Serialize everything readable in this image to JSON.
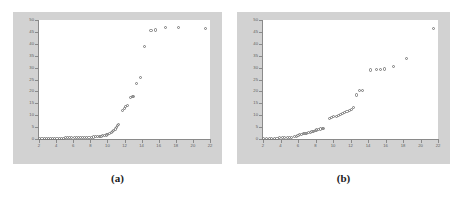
{
  "figure": {
    "background_color": "#ffffff",
    "panel_background_color": "#d2d2d2",
    "plot_background_color": "#ffffff",
    "marker_color": "#7a7a7a",
    "axis_color": "#8a8a8a"
  },
  "panels": [
    {
      "caption": "(a)"
    },
    {
      "caption": "(b)"
    }
  ],
  "chart_data": [
    {
      "type": "scatter",
      "title": "",
      "subtitle": "",
      "caption": "(a)",
      "xlabel": "",
      "ylabel": "",
      "xlim": [
        2,
        22
      ],
      "ylim": [
        0,
        50
      ],
      "xticks": [
        2,
        4,
        6,
        8,
        10,
        12,
        14,
        16,
        18,
        20,
        22
      ],
      "xtick_labels": [
        "2",
        "4",
        "6",
        "8",
        "10",
        "12",
        "14",
        "16",
        "18",
        "20",
        "22"
      ],
      "yticks": [
        0,
        5,
        10,
        15,
        20,
        25,
        30,
        35,
        40,
        45,
        50
      ],
      "ytick_labels": [
        "0",
        "5",
        "10",
        "15",
        "20",
        "25",
        "30",
        "35",
        "40",
        "45",
        "50"
      ],
      "grid": false,
      "legend": null,
      "marker": "open-circle",
      "points": [
        [
          2.1,
          0.2
        ],
        [
          2.35,
          0.2
        ],
        [
          2.6,
          0.25
        ],
        [
          2.85,
          0.25
        ],
        [
          3.1,
          0.3
        ],
        [
          3.35,
          0.3
        ],
        [
          3.6,
          0.3
        ],
        [
          3.85,
          0.35
        ],
        [
          4.1,
          0.35
        ],
        [
          4.35,
          0.4
        ],
        [
          4.6,
          0.4
        ],
        [
          4.85,
          0.4
        ],
        [
          5.1,
          0.45
        ],
        [
          5.35,
          0.45
        ],
        [
          5.6,
          0.5
        ],
        [
          5.85,
          0.5
        ],
        [
          6.1,
          0.55
        ],
        [
          6.35,
          0.55
        ],
        [
          6.6,
          0.6
        ],
        [
          6.85,
          0.6
        ],
        [
          7.1,
          0.65
        ],
        [
          7.35,
          0.7
        ],
        [
          7.6,
          0.7
        ],
        [
          7.85,
          0.75
        ],
        [
          8.1,
          0.8
        ],
        [
          8.35,
          0.85
        ],
        [
          8.6,
          0.9
        ],
        [
          8.85,
          1.0
        ],
        [
          9.05,
          1.1
        ],
        [
          9.25,
          1.2
        ],
        [
          9.45,
          1.35
        ],
        [
          9.65,
          1.5
        ],
        [
          9.85,
          1.7
        ],
        [
          10.05,
          1.9
        ],
        [
          10.25,
          2.2
        ],
        [
          10.45,
          2.6
        ],
        [
          10.6,
          3.0
        ],
        [
          10.75,
          3.5
        ],
        [
          10.9,
          4.2
        ],
        [
          11.05,
          5.0
        ],
        [
          11.2,
          5.6
        ],
        [
          11.35,
          6.0
        ],
        [
          11.8,
          12.0
        ],
        [
          11.95,
          12.8
        ],
        [
          12.15,
          13.8
        ],
        [
          12.35,
          14.2
        ],
        [
          12.7,
          17.5
        ],
        [
          12.9,
          17.8
        ],
        [
          13.1,
          18.0
        ],
        [
          13.45,
          23.5
        ],
        [
          13.9,
          25.8
        ],
        [
          14.35,
          39.0
        ],
        [
          15.1,
          45.5
        ],
        [
          15.6,
          45.8
        ],
        [
          16.8,
          46.8
        ],
        [
          18.35,
          46.8
        ],
        [
          21.5,
          46.5
        ]
      ]
    },
    {
      "type": "scatter",
      "title": "",
      "subtitle": "",
      "caption": "(b)",
      "xlabel": "",
      "ylabel": "",
      "xlim": [
        2,
        22
      ],
      "ylim": [
        0,
        50
      ],
      "xticks": [
        2,
        4,
        6,
        8,
        10,
        12,
        14,
        16,
        18,
        20,
        22
      ],
      "xtick_labels": [
        "2",
        "4",
        "6",
        "8",
        "10",
        "12",
        "14",
        "16",
        "18",
        "20",
        "22"
      ],
      "yticks": [
        0,
        5,
        10,
        15,
        20,
        25,
        30,
        35,
        40,
        45,
        50
      ],
      "ytick_labels": [
        "0",
        "5",
        "10",
        "15",
        "20",
        "25",
        "30",
        "35",
        "40",
        "45",
        "50"
      ],
      "grid": false,
      "legend": null,
      "marker": "open-circle",
      "points": [
        [
          2.1,
          0.2
        ],
        [
          2.4,
          0.25
        ],
        [
          2.7,
          0.3
        ],
        [
          3.0,
          0.3
        ],
        [
          3.3,
          0.35
        ],
        [
          3.6,
          0.4
        ],
        [
          3.9,
          0.45
        ],
        [
          4.2,
          0.5
        ],
        [
          4.5,
          0.55
        ],
        [
          4.8,
          0.6
        ],
        [
          5.05,
          0.7
        ],
        [
          5.3,
          0.8
        ],
        [
          5.55,
          0.9
        ],
        [
          5.8,
          1.0
        ],
        [
          6.0,
          1.6
        ],
        [
          6.2,
          1.8
        ],
        [
          6.4,
          2.0
        ],
        [
          6.6,
          2.2
        ],
        [
          6.8,
          2.4
        ],
        [
          7.0,
          2.5
        ],
        [
          7.2,
          2.6
        ],
        [
          7.4,
          2.7
        ],
        [
          7.6,
          3.0
        ],
        [
          7.8,
          3.2
        ],
        [
          8.0,
          3.6
        ],
        [
          8.15,
          3.8
        ],
        [
          8.35,
          4.0
        ],
        [
          8.55,
          4.2
        ],
        [
          8.75,
          4.3
        ],
        [
          8.95,
          4.4
        ],
        [
          9.6,
          8.5
        ],
        [
          9.85,
          8.9
        ],
        [
          10.1,
          9.3
        ],
        [
          10.35,
          9.6
        ],
        [
          10.6,
          10.0
        ],
        [
          10.85,
          10.4
        ],
        [
          11.1,
          10.9
        ],
        [
          11.35,
          11.2
        ],
        [
          11.6,
          11.6
        ],
        [
          11.85,
          12.0
        ],
        [
          12.1,
          12.5
        ],
        [
          12.35,
          13.3
        ],
        [
          12.7,
          18.5
        ],
        [
          13.05,
          20.3
        ],
        [
          13.35,
          20.5
        ],
        [
          14.3,
          29.0
        ],
        [
          14.95,
          29.3
        ],
        [
          15.45,
          29.3
        ],
        [
          15.85,
          29.4
        ],
        [
          16.9,
          30.3
        ],
        [
          18.45,
          33.8
        ],
        [
          21.5,
          46.5
        ]
      ]
    }
  ]
}
